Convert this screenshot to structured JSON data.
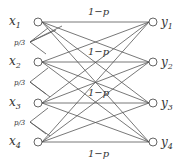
{
  "diagram": {
    "inputs": [
      {
        "label": "x",
        "sub": "1"
      },
      {
        "label": "x",
        "sub": "2"
      },
      {
        "label": "x",
        "sub": "3"
      },
      {
        "label": "x",
        "sub": "4"
      }
    ],
    "outputs": [
      {
        "label": "y",
        "sub": "1"
      },
      {
        "label": "y",
        "sub": "2"
      },
      {
        "label": "y",
        "sub": "3"
      },
      {
        "label": "y",
        "sub": "4"
      }
    ],
    "direct_prob": "1−p",
    "cross_prob": "p/3",
    "colors": {
      "line": "#444444",
      "text": "#333333"
    }
  }
}
